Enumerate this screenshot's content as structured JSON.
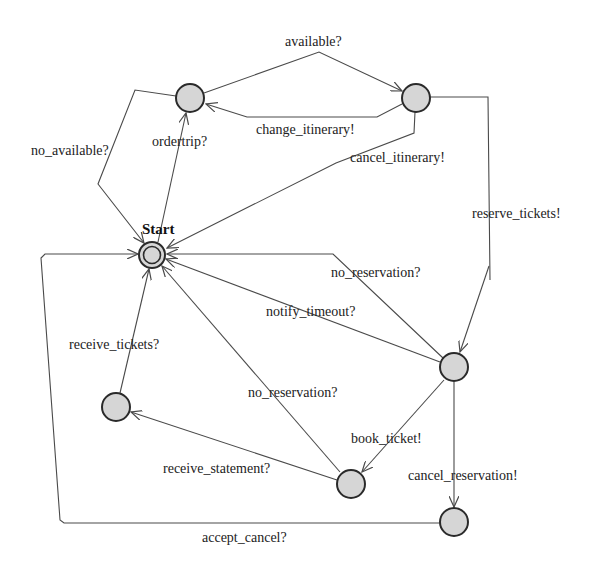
{
  "diagram": {
    "type": "state-machine",
    "initial_state": "Start",
    "colors": {
      "node_fill": "#d6d6d6",
      "node_stroke": "#2a2a2a",
      "edge": "#4a4a4a",
      "text": "#222222",
      "background": "#ffffff"
    },
    "nodes": [
      {
        "id": "start",
        "label": "Start",
        "initial": true
      },
      {
        "id": "s1",
        "label": ""
      },
      {
        "id": "s2",
        "label": ""
      },
      {
        "id": "s3",
        "label": ""
      },
      {
        "id": "s4",
        "label": ""
      },
      {
        "id": "s5",
        "label": ""
      },
      {
        "id": "s6",
        "label": ""
      }
    ],
    "edges": [
      {
        "from": "start",
        "to": "s1",
        "label": "ordertrip?"
      },
      {
        "from": "s1",
        "to": "s2",
        "label": "available?"
      },
      {
        "from": "s1",
        "to": "start",
        "label": "no_available?"
      },
      {
        "from": "s2",
        "to": "s1",
        "label": "change_itinerary!"
      },
      {
        "from": "s2",
        "to": "start",
        "label": "cancel_itinerary!"
      },
      {
        "from": "s2",
        "to": "s3",
        "label": "reserve_tickets!"
      },
      {
        "from": "s3",
        "to": "start",
        "label": "no_reservation?"
      },
      {
        "from": "s3",
        "to": "start",
        "label": "notify_timeout?"
      },
      {
        "from": "s3",
        "to": "s5",
        "label": "book_ticket!"
      },
      {
        "from": "s3",
        "to": "s6",
        "label": "cancel_reservation!"
      },
      {
        "from": "s5",
        "to": "start",
        "label": "no_reservation?"
      },
      {
        "from": "s5",
        "to": "s4",
        "label": "receive_statement?"
      },
      {
        "from": "s4",
        "to": "start",
        "label": "receive_tickets?"
      },
      {
        "from": "s6",
        "to": "start",
        "label": "accept_cancel?"
      }
    ]
  },
  "labels": {
    "start": "Start",
    "available": "available?",
    "ordertrip": "ordertrip?",
    "no_available": "no_available?",
    "change_itinerary": "change_itinerary!",
    "cancel_itinerary": "cancel_itinerary!",
    "reserve_tickets": "reserve_tickets!",
    "no_reservation_1": "no_reservation?",
    "notify_timeout": "notify_timeout?",
    "receive_tickets": "receive_tickets?",
    "no_reservation_2": "no_reservation?",
    "book_ticket": "book_ticket!",
    "receive_statement": "receive_statement?",
    "cancel_reservation": "cancel_reservation!",
    "accept_cancel": "accept_cancel?"
  }
}
